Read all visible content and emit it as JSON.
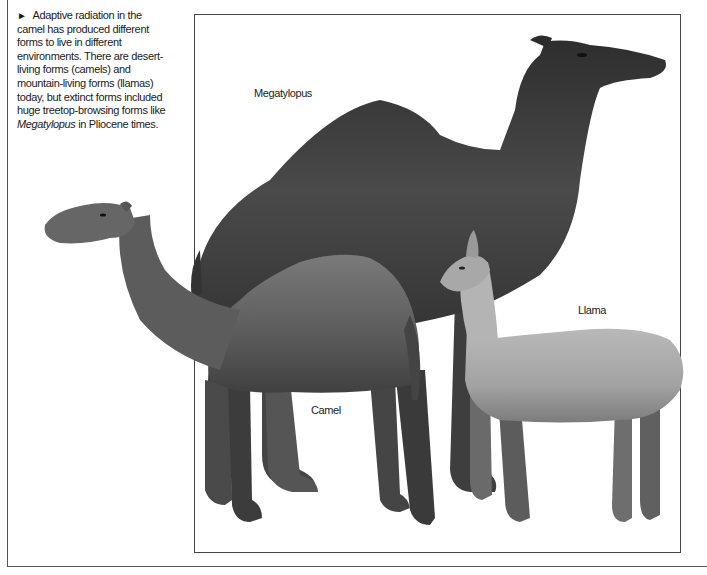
{
  "caption": {
    "marker": "►",
    "text_before": "Adaptive radiation in the camel has produced different forms to live in different environments. There are desert-living forms (camels) and mountain-living forms (llamas) today, but extinct forms included huge treetop-browsing forms like ",
    "italic_term": "Megatylopus",
    "text_after": " in Pliocene times."
  },
  "figure": {
    "labels": {
      "megatylopus": "Megatylopus",
      "camel": "Camel",
      "llama": "Llama"
    },
    "colors": {
      "megatylopus_fur": "#3a3a3a",
      "camel_fur": "#5e5e5e",
      "llama_fur": "#a9a9a9",
      "frame": "#444444"
    }
  }
}
